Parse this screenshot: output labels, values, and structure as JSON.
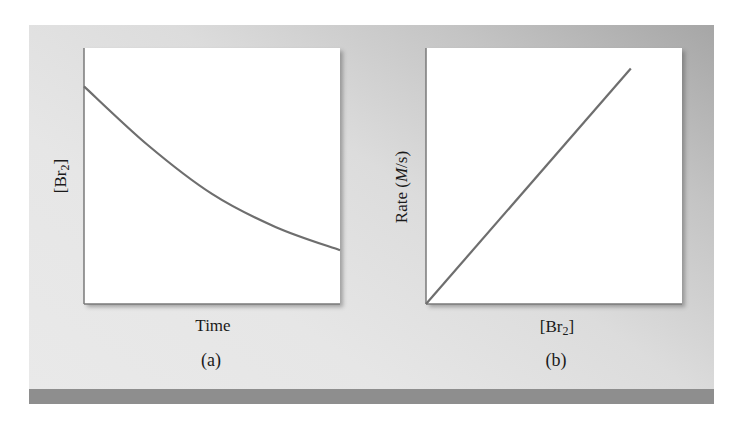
{
  "figure": {
    "panel_letters": [
      "(a)",
      "(b)"
    ],
    "colors": {
      "panel_light": "#e9e9e9",
      "panel_dark": "#a6a6a6",
      "bottom_bar": "#8e8e8e",
      "plot_bg": "#ffffff",
      "curve": "#6e6e6e",
      "axis": "#7a7a7a"
    }
  },
  "plot_a": {
    "xlabel": "Time",
    "ylabel_main": "[Br",
    "ylabel_sub": "2",
    "ylabel_close": "]",
    "letter": "(a)"
  },
  "plot_b": {
    "xlabel_main": "[Br",
    "xlabel_sub": "2",
    "xlabel_close": "]",
    "ylabel_pre": "Rate (",
    "ylabel_unit_italic": "M",
    "ylabel_post": "/s)",
    "letter": "(b)"
  },
  "chart_data": [
    {
      "type": "line",
      "title": "(a)",
      "xlabel": "Time",
      "ylabel": "[Br2]",
      "description": "Concentration of Br2 decreasing with time (exponential decay, first-order)",
      "x": [
        0,
        0.25,
        0.5,
        0.75,
        1.0
      ],
      "y": [
        0.85,
        0.62,
        0.43,
        0.3,
        0.21
      ],
      "xlim": [
        0,
        1
      ],
      "ylim": [
        0,
        1
      ],
      "grid": false,
      "ticks": false,
      "units": "arbitrary (normalized to plot box)"
    },
    {
      "type": "line",
      "title": "(b)",
      "xlabel": "[Br2]",
      "ylabel": "Rate (M/s)",
      "description": "Rate directly proportional to [Br2] (straight line through origin)",
      "x": [
        0,
        0.8
      ],
      "y": [
        0,
        0.92
      ],
      "xlim": [
        0,
        1
      ],
      "ylim": [
        0,
        1
      ],
      "grid": false,
      "ticks": false,
      "units": "arbitrary (normalized to plot box)"
    }
  ]
}
